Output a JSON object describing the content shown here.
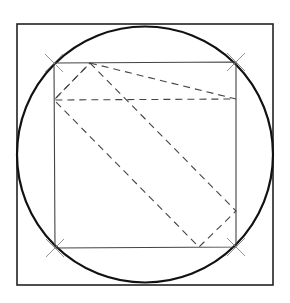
{
  "figure": {
    "width": 290,
    "height": 303,
    "background": "#ffffff",
    "outer_square": {
      "x": 17,
      "y": 24,
      "w": 256,
      "h": 261,
      "stroke": "#222222",
      "stroke_width": 1.6
    },
    "circle": {
      "cx": 145,
      "cy": 154.5,
      "r": 128,
      "stroke": "#111111",
      "stroke_width": 2.2
    },
    "inner_square": {
      "points": [
        [
          54,
          63
        ],
        [
          236,
          62
        ],
        [
          236,
          247
        ],
        [
          55,
          248
        ]
      ],
      "stroke": "#444444",
      "stroke_width": 1.1
    },
    "tick_marks": {
      "points": [
        [
          54,
          63
        ],
        [
          236,
          62
        ],
        [
          236,
          247
        ],
        [
          55,
          248
        ]
      ],
      "size": 9,
      "stroke": "#888888",
      "stroke_width": 0.9
    },
    "dashed_rectangle": {
      "points": [
        [
          90,
          63
        ],
        [
          236,
          211
        ],
        [
          199,
          247
        ],
        [
          54,
          100
        ]
      ],
      "stroke": "#444444",
      "stroke_width": 1.1,
      "dash": "7,5"
    },
    "dashed_triangle": {
      "points": [
        [
          90,
          63
        ],
        [
          236,
          99
        ],
        [
          54,
          100
        ]
      ],
      "stroke": "#444444",
      "stroke_width": 1.1,
      "dash": "7,5"
    }
  }
}
